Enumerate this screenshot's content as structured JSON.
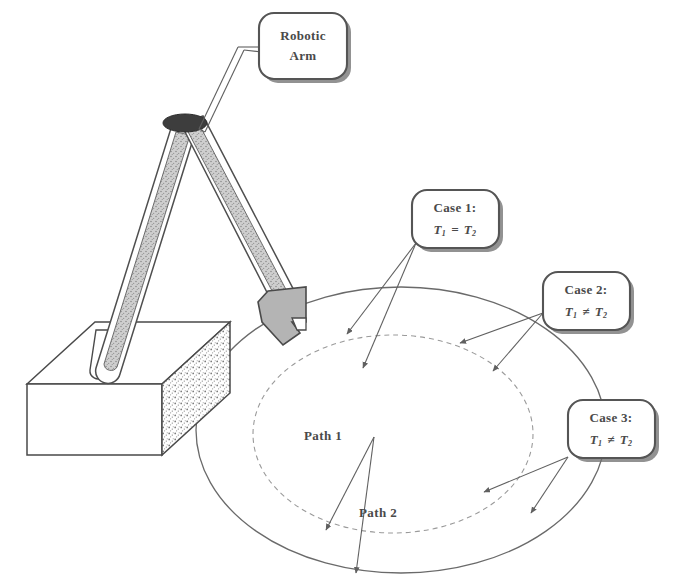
{
  "figure": {
    "background_color": "#ffffff",
    "ink_color": "#4a4a4a",
    "width": 697,
    "height": 583
  },
  "callouts": [
    {
      "id": "robotic-arm",
      "line1": "Robotic",
      "line2": "Arm",
      "has_formula": false
    },
    {
      "id": "case-1",
      "line1": "Case 1:",
      "formula_lhs": "T",
      "formula_lhs_sub": "1",
      "formula_op": "=",
      "formula_rhs": "T",
      "formula_rhs_sub": "2",
      "has_formula": true
    },
    {
      "id": "case-2",
      "line1": "Case 2:",
      "formula_lhs": "T",
      "formula_lhs_sub": "1",
      "formula_op": "≠",
      "formula_rhs": "T",
      "formula_rhs_sub": "2",
      "has_formula": true
    },
    {
      "id": "case-3",
      "line1": "Case 3:",
      "formula_lhs": "T",
      "formula_lhs_sub": "1",
      "formula_op": "≠",
      "formula_rhs": "T",
      "formula_rhs_sub": "2",
      "has_formula": true
    }
  ],
  "paths": [
    {
      "id": "path-1",
      "label": "Path 1"
    },
    {
      "id": "path-2",
      "label": "Path 2"
    }
  ],
  "parts": {
    "base_block": "base-block",
    "lower_arm": "lower-arm-segment",
    "upper_arm": "upper-arm-segment",
    "elbow_joint": "elbow-joint",
    "gripper": "gripper-end-effector",
    "outer_ellipse": "outer-path-ellipse",
    "inner_ellipse": "inner-path-ellipse"
  }
}
